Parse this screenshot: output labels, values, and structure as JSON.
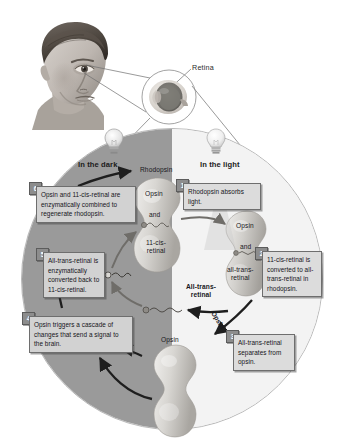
{
  "figure": {
    "retina_label": "Retina",
    "phase_dark": "In the dark",
    "phase_light": "In the light"
  },
  "colors": {
    "dark_half": "#9a9a9a",
    "light_half": "#f3f3f3",
    "callout_fill": "#d2d2d2",
    "callout_border": "#6e6e6e",
    "badge_fill": "#8d8d8d",
    "text": "#15151a",
    "circle_border": "#b9b9b9"
  },
  "steps": [
    {
      "number": "1",
      "text": "Rhodopsin absorbs light."
    },
    {
      "number": "2",
      "text": "11-cis-retinal is converted to all-trans-retinal in rhodopsin."
    },
    {
      "number": "3",
      "text": "All-trans-retinal separates from opsin."
    },
    {
      "number": "4",
      "text": "Opsin triggers a cascade of changes that send a signal to the brain."
    },
    {
      "number": "5",
      "text": "All-trans-retinal is enzymatically converted back to 11-cis-retinal."
    },
    {
      "number": "6",
      "text": "Opsin and 11-cis-retinal are enzymatically combined to regenerate rhodopsin."
    }
  ],
  "molecules": {
    "rhodopsin": "Rhodopsin",
    "opsin_top": "Opsin",
    "and_top": "and",
    "retinal_11cis_line1": "11-cis-",
    "retinal_11cis_line2": "retinal",
    "opsin_right": "Opsin",
    "and_right": "and",
    "alltrans_right_line1": "all-trans-",
    "alltrans_right_line2": "retinal",
    "alltrans_bold_line1": "All-trans-",
    "alltrans_bold_line2": "retinal",
    "opsin_bottom": "Opsin",
    "opsin_diagonal": "Opsin"
  },
  "icons": {
    "bulb_dark": "lightbulb-icon",
    "bulb_light": "lightbulb-icon",
    "head": "human-head-icon",
    "eyeball": "eyeball-cross-section-icon"
  }
}
